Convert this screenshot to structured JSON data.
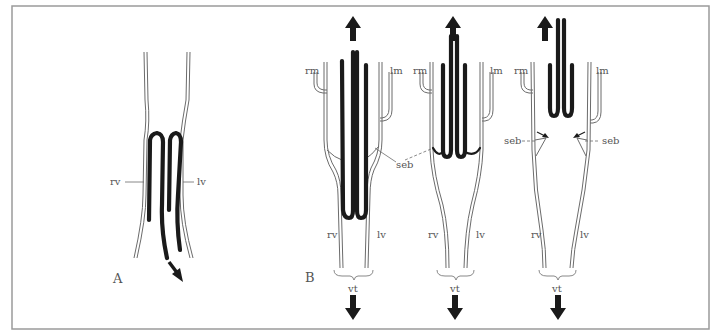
{
  "figure": {
    "panels": [
      {
        "id": "A",
        "label": "A",
        "labels": {
          "right_vessel": "rv",
          "left_vessel": "lv"
        },
        "arrow_direction": "down-right"
      },
      {
        "id": "B",
        "label": "B",
        "stages": [
          {
            "labels": {
              "rm": "rm",
              "lm": "lm",
              "seb": "seb",
              "rv": "rv",
              "lv": "lv",
              "vt": "vt"
            },
            "arrows": [
              "up",
              "down"
            ]
          },
          {
            "labels": {
              "rm": "rm",
              "lm": "lm",
              "rv": "rv",
              "lv": "lv",
              "vt": "vt"
            },
            "arrows": [
              "up",
              "down"
            ]
          },
          {
            "labels": {
              "rm": "rm",
              "lm": "lm",
              "seb_left": "seb",
              "seb_right": "seb",
              "rv": "rv",
              "lv": "lv",
              "vt": "vt"
            },
            "arrows": [
              "up",
              "down"
            ]
          }
        ]
      }
    ],
    "colors": {
      "frame": "#9a9a9a",
      "wall": "#6b6b6b",
      "fold": "#1a1a1a",
      "label": "#555555"
    }
  }
}
